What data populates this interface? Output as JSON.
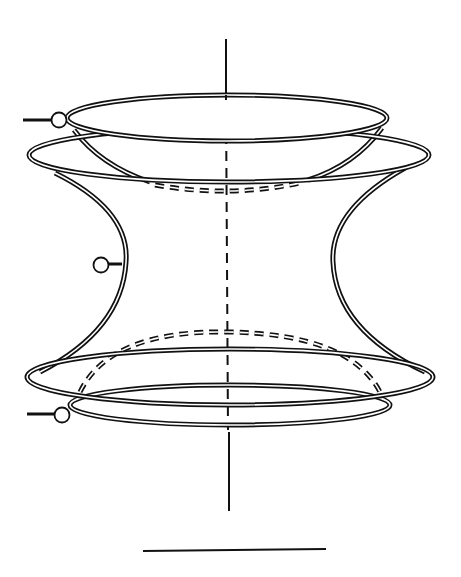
{
  "figure": {
    "type": "line-drawing",
    "colors": {
      "ink": "#111111",
      "background": "#ffffff"
    },
    "axis": {
      "x": 226,
      "y_top": 39,
      "y_bottom": 511,
      "dashed_from": 97,
      "dashed_to": 430
    },
    "rings": [
      {
        "name": "top-inner-ring",
        "cx": 227,
        "cy": 124,
        "rx": 160,
        "ry": 22
      },
      {
        "name": "top-outer-ring",
        "cx": 229,
        "cy": 155,
        "rx": 200,
        "ry": 27
      },
      {
        "name": "bottom-outer-ring",
        "cx": 230,
        "cy": 375,
        "rx": 203,
        "ry": 27
      },
      {
        "name": "bottom-inner-ring",
        "cx": 230,
        "cy": 405,
        "rx": 160,
        "ry": 20
      }
    ],
    "nodes": [
      {
        "name": "top-terminal",
        "cx": 59,
        "cy": 120,
        "r": 7,
        "lead_from": 23
      },
      {
        "name": "middle-terminal",
        "cx": 101,
        "cy": 264,
        "r": 7,
        "lead_to": 120
      },
      {
        "name": "bottom-terminal",
        "cx": 62,
        "cy": 415,
        "r": 7,
        "lead_from": 27
      }
    ],
    "scale_bar": {
      "x1": 143,
      "x2": 326,
      "y": 550
    }
  }
}
